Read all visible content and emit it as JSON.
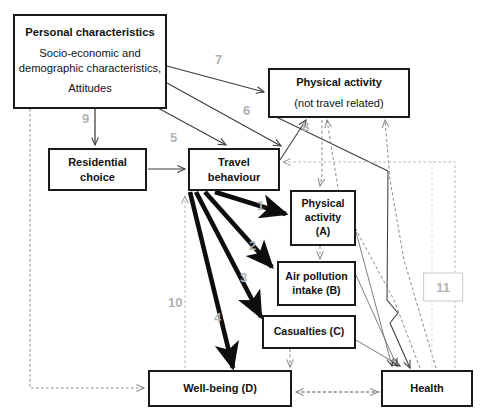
{
  "diagram": {
    "colors": {
      "node_border": "#1a1a1a",
      "node_fill": "#ffffff",
      "thick_arrow": "#0d0d0d",
      "thin_arrow": "#3c3c3c",
      "dashed_arrow": "#777777",
      "label_grey": "#b2b2b2",
      "label_box_border": "#c9c9c9"
    },
    "nodes": [
      {
        "id": "personal",
        "name": "personal-characteristics",
        "title": "Personal characteristics",
        "line1": "Socio-economic and",
        "line2": "demographic characteristics,",
        "line3": "Attitudes"
      },
      {
        "id": "physical-activity-ntr",
        "name": "physical-activity-not-travel-related",
        "title": "Physical activity",
        "subtitle": "(not travel related)"
      },
      {
        "id": "residential",
        "name": "residential-choice",
        "line1": "Residential",
        "line2": "choice"
      },
      {
        "id": "travel",
        "name": "travel-behaviour",
        "line1": "Travel",
        "line2": "behaviour"
      },
      {
        "id": "pa-a",
        "name": "physical-activity-a",
        "line1": "Physical",
        "line2": "activity",
        "line3": "(A)"
      },
      {
        "id": "air",
        "name": "air-pollution-intake-b",
        "line1": "Air pollution",
        "line2": "intake (B)"
      },
      {
        "id": "casualties",
        "name": "casualties-c",
        "line1": "Casualties (C)"
      },
      {
        "id": "wellbeing",
        "name": "well-being-d",
        "line1": "Well-being (D)"
      },
      {
        "id": "health",
        "name": "health",
        "line1": "Health"
      }
    ],
    "edge_labels": [
      {
        "id": "1",
        "text": "1",
        "style": "plain"
      },
      {
        "id": "2",
        "text": "2",
        "style": "plain"
      },
      {
        "id": "3",
        "text": "3",
        "style": "plain"
      },
      {
        "id": "4",
        "text": "4",
        "style": "plain"
      },
      {
        "id": "5",
        "text": "5",
        "style": "plain"
      },
      {
        "id": "6",
        "text": "6",
        "style": "plain"
      },
      {
        "id": "7",
        "text": "7",
        "style": "plain"
      },
      {
        "id": "8",
        "text": "8",
        "style": "plain"
      },
      {
        "id": "9",
        "text": "9",
        "style": "plain"
      },
      {
        "id": "10",
        "text": "10",
        "style": "plain"
      },
      {
        "id": "11",
        "text": "11",
        "style": "boxed"
      }
    ]
  }
}
